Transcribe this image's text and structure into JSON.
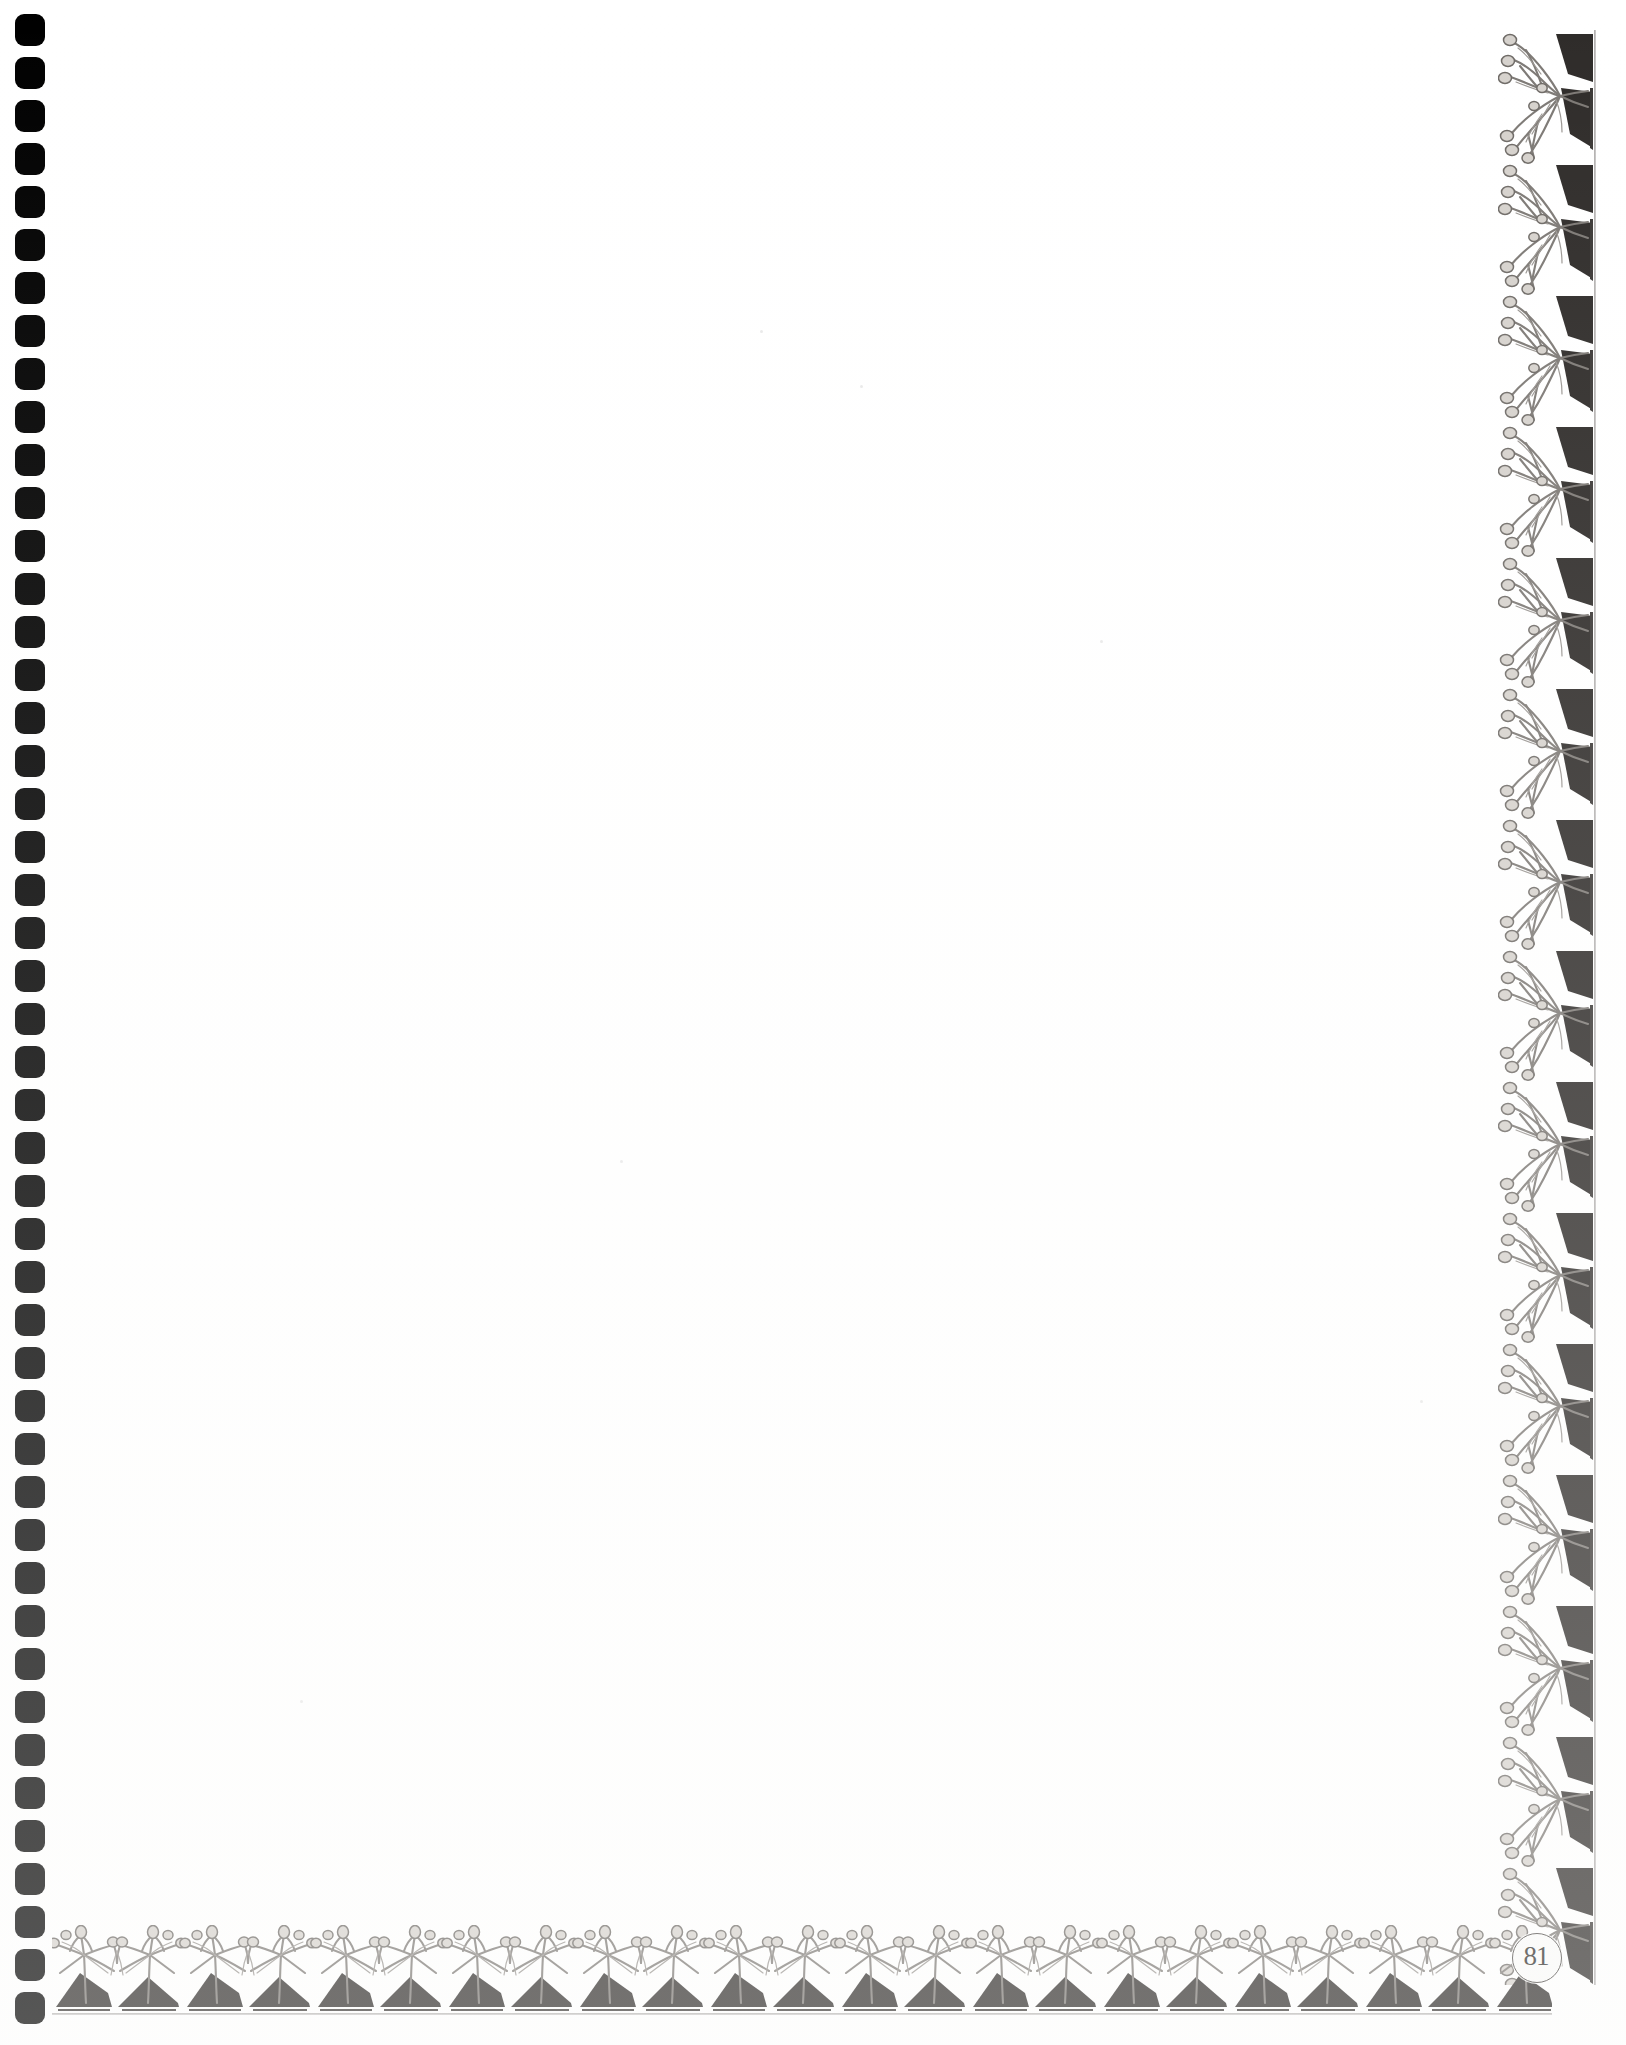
{
  "document": {
    "kind": "scanned-book-page",
    "page_number": "81",
    "page_width": 1626,
    "page_height": 2045,
    "background_color": "#ffffff",
    "ink_color": "#4a4744",
    "content_text": ""
  },
  "binding": {
    "name": "spiral-binding-holes",
    "hole_count": 47,
    "hole_color": "#000000",
    "hole_width": 30,
    "hole_height": 32,
    "hole_pitch": 43,
    "first_hole_top": 14,
    "left_offset": 15
  },
  "borders": {
    "right": {
      "label": "right-ornamental-border",
      "motif": "botanical-engraving",
      "tile_height": 131,
      "tile_count": 15,
      "left": 1498,
      "top": 30,
      "width": 98,
      "height": 1955
    },
    "bottom": {
      "label": "bottom-ornamental-border",
      "motif": "botanical-engraving",
      "tile_width": 131,
      "tile_count": 12,
      "left": 52,
      "top": 1925,
      "width": 1500,
      "height": 90
    }
  },
  "page_number_medallion": {
    "label": "page-number-medallion",
    "value": "81",
    "shape": "circle",
    "diameter": 48,
    "center_x": 1536,
    "center_y": 1957,
    "fill": "#fbfbfa",
    "outline": "#4a4744"
  },
  "content": {
    "area_label": "blank-page-body",
    "text": "",
    "left": 60,
    "top": 30,
    "width": 1430,
    "height": 1890
  }
}
